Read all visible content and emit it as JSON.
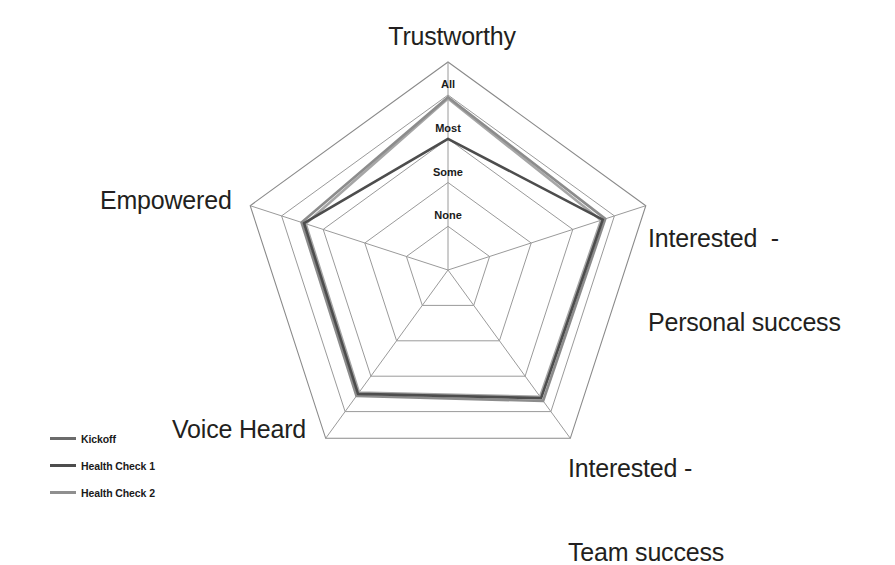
{
  "chart_data": {
    "type": "radar",
    "title": "",
    "categories": [
      "Trustworthy",
      "Interested  -\nPersonal success",
      "Interested -\nTeam success",
      "Voice Heard",
      "Empowered"
    ],
    "category_labels_flat": [
      "Trustworthy",
      "Interested - Personal success",
      "Interested - Team success",
      "Voice Heard",
      "Empowered"
    ],
    "tick_labels": [
      "None",
      "Some",
      "Most",
      "All"
    ],
    "tick_values": [
      1,
      2,
      3,
      4
    ],
    "scale_min": 0,
    "scale_max": 4,
    "grid": true,
    "legend_position": "bottom-left",
    "series": [
      {
        "name": "Kickoff",
        "color": "#8c8c8c",
        "values": [
          3.95,
          3.78,
          3.7,
          3.56,
          3.52
        ],
        "value_labels": [
          "All",
          "All",
          "Most",
          "Most",
          "Most"
        ]
      },
      {
        "name": "Health Check 1",
        "color": "#4d4d4d",
        "values": [
          3.0,
          3.72,
          3.62,
          3.5,
          3.46
        ],
        "value_labels": [
          "Most",
          "All",
          "Most",
          "Most",
          "Most"
        ]
      },
      {
        "name": "Health Check 2",
        "color": "#a6a6a6",
        "values": [
          3.92,
          3.68,
          3.58,
          3.46,
          3.42
        ],
        "value_labels": [
          "All",
          "All",
          "Most",
          "Most",
          "Most"
        ]
      }
    ]
  },
  "legend": {
    "items": [
      {
        "label": "Kickoff",
        "color": "#6b6b6b"
      },
      {
        "label": "Health Check 1",
        "color": "#4d4d4d"
      },
      {
        "label": "Health Check 2",
        "color": "#8f8f8f"
      }
    ]
  },
  "ticks": {
    "all": "All",
    "most": "Most",
    "some": "Some",
    "none": "None"
  },
  "labels": {
    "trustworthy": "Trustworthy",
    "personal_line1": "Interested  -",
    "personal_line2": "Personal success",
    "team_line1": "Interested -",
    "team_line2": "Team success",
    "voice": "Voice Heard",
    "empowered": "Empowered"
  },
  "colors": {
    "grid": "#9a9a9a",
    "outer_frame": "#8a8a8a",
    "background": "#ffffff",
    "text": "#231f20"
  }
}
